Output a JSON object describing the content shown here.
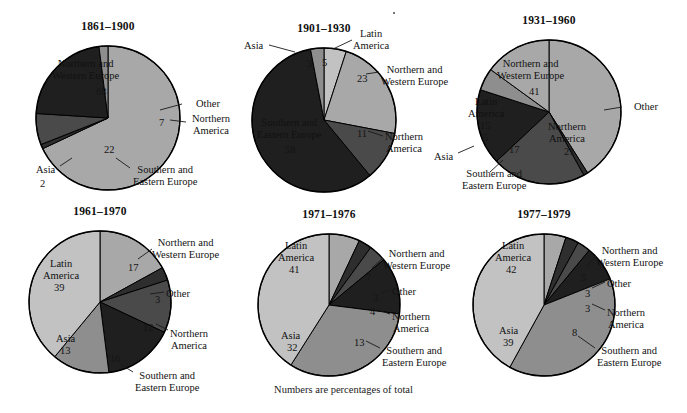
{
  "figure": {
    "caption": "Numbers are percentages of total",
    "caption_x": 0,
    "caption_y": 384
  },
  "colors": {
    "northern_western_europe": "#a8a8a8",
    "latin_america": "#c2c2c2",
    "asia": "#8e8e8e",
    "northern_america": "#4a4a4a",
    "southern_eastern_europe": "#1f1f1f",
    "other": "#2e2e2e",
    "outline": "#000000",
    "background": "#ffffff",
    "text": "#141414"
  },
  "chart_data": [
    {
      "type": "pie",
      "title": "1861–1900",
      "cx": 108,
      "cy": 118,
      "r": 72,
      "start_angle": -90,
      "categories": [
        "Northern and Western Europe",
        "Other",
        "Northern America",
        "Southern and Eastern Europe",
        "Asia"
      ],
      "values": [
        68,
        1,
        7,
        22,
        2
      ],
      "labels": [
        {
          "name": "Northern and Western Europe",
          "text": "Northern and\nWestern Europe",
          "value": "68",
          "placement": "inside",
          "x": 52,
          "y": 58,
          "vx": 96,
          "vy": 86,
          "fill": "#a8a8a8"
        },
        {
          "name": "Other",
          "text": "Other",
          "value": "",
          "placement": "outside",
          "x": 196,
          "y": 98,
          "leader": [
            [
              182,
              104
            ],
            [
              160,
              110
            ]
          ],
          "fill": "#2e2e2e"
        },
        {
          "name": "Northern America",
          "text": "Northern\nAmerica",
          "value": "7",
          "placement": "outside",
          "x": 192,
          "y": 113,
          "vx": 159,
          "vy": 117,
          "leader": [
            [
              186,
              122
            ],
            [
              170,
              120
            ]
          ],
          "fill": "#4a4a4a"
        },
        {
          "name": "Southern and Eastern Europe",
          "text": "Southern and\nEastern Europe",
          "value": "22",
          "placement": "outside",
          "x": 133,
          "y": 164,
          "vx": 104,
          "vy": 144,
          "leader": [
            [
              130,
              168
            ],
            [
              116,
              158
            ]
          ],
          "fill": "#1f1f1f"
        },
        {
          "name": "Asia",
          "text": "Asia",
          "value": "2",
          "placement": "outside",
          "x": 36,
          "y": 164,
          "vx": 40,
          "vy": 178,
          "leader": [
            [
              60,
              166
            ],
            [
              72,
              158
            ]
          ],
          "fill": "#8e8e8e"
        }
      ]
    },
    {
      "type": "pie",
      "title": "1901–1930",
      "cx": 324,
      "cy": 120,
      "r": 72,
      "start_angle": -90,
      "categories": [
        "Latin America",
        "Northern and Western Europe",
        "Northern America",
        "Southern and Eastern Europe",
        "Asia"
      ],
      "values": [
        5,
        23,
        11,
        58,
        3
      ],
      "labels": [
        {
          "name": "Asia",
          "text": "Asia",
          "value": "3",
          "placement": "outside",
          "x": 244,
          "y": 40,
          "vx": 307,
          "vy": 58,
          "leader": [
            [
              269,
              45
            ],
            [
              295,
              52
            ]
          ],
          "fill": "#8e8e8e"
        },
        {
          "name": "Latin America",
          "text": "Latin\nAmerica",
          "value": "5",
          "placement": "outside",
          "x": 353,
          "y": 28,
          "vx": 322,
          "vy": 57,
          "leader": [
            [
              352,
              40
            ],
            [
              333,
              49
            ]
          ],
          "fill": "#c2c2c2"
        },
        {
          "name": "Northern and Western Europe",
          "text": "Northern and\nWestern Europe",
          "value": "23",
          "placement": "outside",
          "x": 381,
          "y": 64,
          "vx": 357,
          "vy": 73,
          "leader": [
            [
              379,
              72
            ],
            [
              366,
              74
            ]
          ],
          "fill": "#a8a8a8"
        },
        {
          "name": "Northern America",
          "text": "Northern\nAmerica",
          "value": "11",
          "placement": "outside",
          "x": 385,
          "y": 131,
          "vx": 357,
          "vy": 128,
          "leader": [
            [
              383,
              136
            ],
            [
              368,
              131
            ]
          ],
          "fill": "#4a4a4a"
        },
        {
          "name": "Southern and Eastern Europe",
          "text": "Southern and\nEastern Europe",
          "value": "58",
          "placement": "inside",
          "x": 257,
          "y": 117,
          "vx": 285,
          "vy": 144,
          "fill": "#1f1f1f"
        }
      ]
    },
    {
      "type": "pie",
      "title": "1931–1960",
      "cx": 549,
      "cy": 112,
      "r": 72,
      "start_angle": -90,
      "categories": [
        "Northern and Western Europe",
        "Other",
        "Northern America",
        "Southern and Eastern Europe",
        "Asia",
        "Latin America"
      ],
      "values": [
        41,
        1,
        21,
        17,
        5,
        15
      ],
      "labels": [
        {
          "name": "Northern and Western Europe",
          "text": "Northern and\nWestern Europe",
          "value": "41",
          "placement": "inside",
          "x": 497,
          "y": 58,
          "vx": 529,
          "vy": 86,
          "fill": "#a8a8a8"
        },
        {
          "name": "Other",
          "text": "Other",
          "value": "",
          "placement": "outside",
          "x": 634,
          "y": 101,
          "leader": [
            [
              622,
              107
            ],
            [
              604,
              110
            ]
          ],
          "fill": "#2e2e2e"
        },
        {
          "name": "Northern America",
          "text": "Northern\nAmerica",
          "value": "21",
          "placement": "inside",
          "x": 548,
          "y": 121,
          "vx": 564,
          "vy": 146,
          "fill": "#4a4a4a"
        },
        {
          "name": "Southern and Eastern Europe",
          "text": "Southern and\nEastern Europe",
          "value": "17",
          "placement": "outside",
          "x": 462,
          "y": 168,
          "vx": 509,
          "vy": 144,
          "leader": [
            [
              490,
              172
            ],
            [
              503,
              160
            ]
          ],
          "fill": "#1f1f1f"
        },
        {
          "name": "Asia",
          "text": "Asia",
          "value": "5",
          "placement": "outside",
          "x": 434,
          "y": 151,
          "vx": 483,
          "vy": 132,
          "leader": [
            [
              458,
              153
            ],
            [
              474,
              146
            ]
          ],
          "fill": "#8e8e8e"
        },
        {
          "name": "Latin America",
          "text": "Latin\nAmerica",
          "value": "15",
          "placement": "inside",
          "x": 468,
          "y": 96,
          "vx": 480,
          "vy": 120,
          "fill": "#a8a8a8"
        }
      ]
    },
    {
      "type": "pie",
      "title": "1961–1970",
      "cx": 100,
      "cy": 302,
      "r": 71,
      "start_angle": -90,
      "categories": [
        "Northern and Western Europe",
        "Other",
        "Northern America",
        "Southern and Eastern Europe",
        "Asia",
        "Latin America"
      ],
      "values": [
        17,
        3,
        12,
        16,
        13,
        39
      ],
      "labels": [
        {
          "name": "Northern and Western Europe",
          "text": "Northern and\nWestern Europe",
          "value": "17",
          "placement": "outside",
          "x": 152,
          "y": 237,
          "vx": 128,
          "vy": 262,
          "leader": [
            [
              152,
              249
            ],
            [
              138,
              259
            ]
          ],
          "fill": "#a8a8a8"
        },
        {
          "name": "Other",
          "text": "Other",
          "value": "3",
          "placement": "outside",
          "x": 166,
          "y": 288,
          "vx": 155,
          "vy": 294,
          "leader": [
            [
              164,
              292
            ],
            [
              150,
              294
            ]
          ],
          "fill": "#2e2e2e"
        },
        {
          "name": "Northern America",
          "text": "Northern\nAmerica",
          "value": "12",
          "placement": "outside",
          "x": 170,
          "y": 328,
          "vx": 143,
          "vy": 322,
          "leader": [
            [
              168,
              330
            ],
            [
              156,
              324
            ]
          ],
          "fill": "#4a4a4a"
        },
        {
          "name": "Southern and Eastern Europe",
          "text": "Southern and\nEastern Europe",
          "value": "16",
          "placement": "outside",
          "x": 135,
          "y": 370,
          "vx": 110,
          "vy": 353,
          "leader": [
            [
              133,
              372
            ],
            [
              120,
              364
            ]
          ],
          "fill": "#1f1f1f"
        },
        {
          "name": "Asia",
          "text": "Asia",
          "value": "13",
          "placement": "inside",
          "x": 56,
          "y": 333,
          "vx": 60,
          "vy": 345,
          "fill": "#8e8e8e"
        },
        {
          "name": "Latin America",
          "text": "Latin\nAmerica",
          "value": "39",
          "placement": "inside",
          "x": 43,
          "y": 258,
          "vx": 54,
          "vy": 282,
          "fill": "#c2c2c2"
        }
      ]
    },
    {
      "type": "pie",
      "title": "1971–1976",
      "cx": 329,
      "cy": 305,
      "r": 71,
      "start_angle": -90,
      "categories": [
        "Northern and Western Europe",
        "Other",
        "Northern America",
        "Southern and Eastern Europe",
        "Asia",
        "Latin America"
      ],
      "values": [
        7,
        3,
        4,
        13,
        32,
        41
      ],
      "labels": [
        {
          "name": "Northern and Western Europe",
          "text": "Northern and\nWestern Europe",
          "value": "7",
          "placement": "outside",
          "x": 383,
          "y": 248,
          "vx": 366,
          "vy": 272,
          "leader": [
            [
              383,
              258
            ],
            [
              372,
              268
            ]
          ],
          "fill": "#a8a8a8"
        },
        {
          "name": "Other",
          "text": "Other",
          "value": "3",
          "placement": "outside",
          "x": 392,
          "y": 286,
          "vx": 373,
          "vy": 292,
          "leader": [
            [
              390,
              290
            ],
            [
              380,
              293
            ]
          ],
          "fill": "#2e2e2e"
        },
        {
          "name": "Northern America",
          "text": "Northern\nAmerica",
          "value": "4",
          "placement": "outside",
          "x": 392,
          "y": 311,
          "vx": 370,
          "vy": 306,
          "leader": [
            [
              390,
              314
            ],
            [
              378,
              310
            ]
          ],
          "fill": "#4a4a4a"
        },
        {
          "name": "Southern and Eastern Europe",
          "text": "Southern and\nEastern Europe",
          "value": "13",
          "placement": "outside",
          "x": 382,
          "y": 345,
          "vx": 354,
          "vy": 337,
          "leader": [
            [
              380,
              348
            ],
            [
              366,
              341
            ]
          ],
          "fill": "#1f1f1f"
        },
        {
          "name": "Asia",
          "text": "Asia",
          "value": "32",
          "placement": "inside",
          "x": 281,
          "y": 330,
          "vx": 287,
          "vy": 342,
          "fill": "#8e8e8e"
        },
        {
          "name": "Latin America",
          "text": "Latin\nAmerica",
          "value": "41",
          "placement": "inside",
          "x": 278,
          "y": 240,
          "vx": 289,
          "vy": 264,
          "fill": "#c2c2c2"
        }
      ]
    },
    {
      "type": "pie",
      "title": "1977–1979",
      "cx": 544,
      "cy": 305,
      "r": 71,
      "start_angle": -90,
      "categories": [
        "Northern and Western Europe",
        "Other",
        "Northern America",
        "Southern and Eastern Europe",
        "Asia",
        "Latin America"
      ],
      "values": [
        5,
        3,
        3,
        8,
        39,
        42
      ],
      "labels": [
        {
          "name": "Northern and Western Europe",
          "text": "Northern and\nWestern Europe",
          "value": "5",
          "placement": "outside",
          "x": 596,
          "y": 245,
          "vx": 581,
          "vy": 272,
          "leader": [
            [
              596,
              256
            ],
            [
              586,
              267
            ]
          ],
          "fill": "#a8a8a8"
        },
        {
          "name": "Other",
          "text": "Other",
          "value": "3",
          "placement": "outside",
          "x": 607,
          "y": 278,
          "vx": 585,
          "vy": 288,
          "leader": [
            [
              605,
              282
            ],
            [
              592,
              288
            ]
          ],
          "fill": "#2e2e2e"
        },
        {
          "name": "Northern America",
          "text": "Northern\nAmerica",
          "value": "3",
          "placement": "outside",
          "x": 607,
          "y": 307,
          "vx": 585,
          "vy": 303,
          "leader": [
            [
              605,
              310
            ],
            [
              592,
              304
            ]
          ],
          "fill": "#4a4a4a"
        },
        {
          "name": "Southern and Eastern Europe",
          "text": "Southern and\nEastern Europe",
          "value": "8",
          "placement": "outside",
          "x": 597,
          "y": 345,
          "vx": 572,
          "vy": 327,
          "leader": [
            [
              595,
              348
            ],
            [
              578,
              336
            ]
          ],
          "fill": "#1f1f1f"
        },
        {
          "name": "Asia",
          "text": "Asia",
          "value": "39",
          "placement": "inside",
          "x": 499,
          "y": 325,
          "vx": 503,
          "vy": 337,
          "fill": "#8e8e8e"
        },
        {
          "name": "Latin America",
          "text": "Latin\nAmerica",
          "value": "42",
          "placement": "inside",
          "x": 495,
          "y": 240,
          "vx": 506,
          "vy": 264,
          "fill": "#c2c2c2"
        }
      ]
    }
  ]
}
